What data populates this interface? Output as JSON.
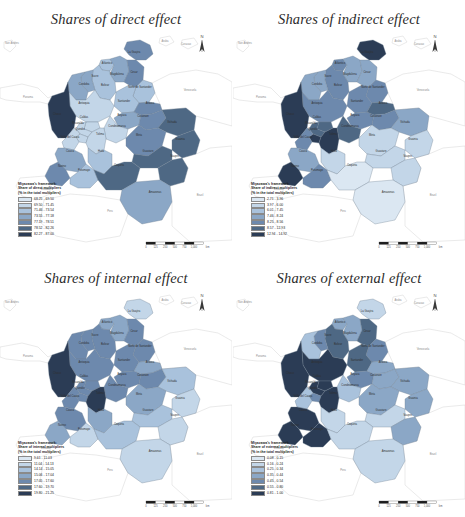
{
  "figure": {
    "kind": "choropleth-map-grid",
    "rows": 2,
    "columns": 2,
    "background": "#ffffff"
  },
  "palette": {
    "classes": [
      "#dbe7f2",
      "#c3d6e8",
      "#a9c2dc",
      "#8ba7c6",
      "#6d89ad",
      "#4e6884",
      "#2b3c55"
    ],
    "neighbor_fill": "#ffffff",
    "neighbor_stroke": "#c9c9c9",
    "boundary_stroke": "#6f7f90",
    "label_color": "#303030",
    "neighbor_label_color": "#8d8d8d",
    "title_color": "#2b2b2b"
  },
  "shared": {
    "north_arrow_label": "N",
    "scalebar": {
      "ticks": [
        "0",
        "125",
        "250",
        "500",
        "750",
        "1,000"
      ],
      "unit": "km",
      "segments": 6
    },
    "legend_line1": "Miyazawa's framework:",
    "legend_line3": "(% in the total multipliers)"
  },
  "panels": [
    {
      "id": "panel-1",
      "title": "Shares of direct effect",
      "legend": {
        "line1": "Miyazawa's framework:",
        "line2": "Share of direct multipliers",
        "line3": "(% in the total multipliers)",
        "classes": [
          {
            "label": "68.25 - 69.50",
            "color": "#dbe7f2"
          },
          {
            "label": "69.50 - 71.45",
            "color": "#c3d6e8"
          },
          {
            "label": "71.46 - 73.54",
            "color": "#a9c2dc"
          },
          {
            "label": "73.55 - 77.18",
            "color": "#8ba7c6"
          },
          {
            "label": "77.19 - 78.51",
            "color": "#6d89ad"
          },
          {
            "label": "78.52 - 82.26",
            "color": "#4e6884"
          },
          {
            "label": "82.27 - 87.00",
            "color": "#2b3c55"
          }
        ]
      },
      "region_classes": {
        "la-guajira": 4,
        "atlantico": 2,
        "magdalena": 3,
        "cesar": 4,
        "bolivar": 2,
        "sucre": 3,
        "cordoba": 3,
        "norte-santander": 2,
        "antioquia": 1,
        "santander": 2,
        "choco": 6,
        "caldas": 1,
        "risaralda": 1,
        "boyaca": 3,
        "arauca": 4,
        "quindio": 1,
        "cundinamarca": 1,
        "casanare": 4,
        "tolima": 1,
        "valle": 1,
        "vichada": 5,
        "huila": 2,
        "meta": 4,
        "cauca": 3,
        "guainia": 5,
        "narino": 4,
        "guaviare": 5,
        "caqueta": 5,
        "vaupes": 5,
        "putumayo": 2,
        "amazonas": 3
      }
    },
    {
      "id": "panel-2",
      "title": "Shares of indirect effect",
      "legend": {
        "line1": "Miyazawa's framework:",
        "line2": "Share of indirect multipliers",
        "line3": "(% in the total multipliers)",
        "classes": [
          {
            "label": "2.71 - 3.96",
            "color": "#dbe7f2"
          },
          {
            "label": "3.97 - 6.00",
            "color": "#c3d6e8"
          },
          {
            "label": "6.01 - 7.45",
            "color": "#a9c2dc"
          },
          {
            "label": "7.46 - 8.24",
            "color": "#8ba7c6"
          },
          {
            "label": "8.25 - 8.56",
            "color": "#6d89ad"
          },
          {
            "label": "8.57 - 12.93",
            "color": "#4e6884"
          },
          {
            "label": "12.94 - 14.92",
            "color": "#2b3c55"
          }
        ]
      },
      "region_classes": {
        "la-guajira": 6,
        "atlantico": 4,
        "magdalena": 3,
        "cesar": 3,
        "bolivar": 4,
        "sucre": 3,
        "cordoba": 3,
        "norte-santander": 4,
        "antioquia": 4,
        "santander": 4,
        "choco": 6,
        "caldas": 5,
        "risaralda": 5,
        "boyaca": 4,
        "arauca": 5,
        "quindio": 6,
        "cundinamarca": 5,
        "casanare": 4,
        "tolima": 6,
        "valle": 4,
        "vichada": 3,
        "huila": 1,
        "meta": 1,
        "cauca": 3,
        "guainia": 1,
        "narino": 6,
        "guaviare": 1,
        "caqueta": 0,
        "vaupes": 1,
        "putumayo": 4,
        "amazonas": 0
      }
    },
    {
      "id": "panel-3",
      "title": "Shares of internal effect",
      "legend": {
        "line1": "Miyazawa's framework:",
        "line2": "Share of internal multipliers",
        "line3": "(% in the total multipliers)",
        "classes": [
          {
            "label": "9.61 - 11.03",
            "color": "#dbe7f2"
          },
          {
            "label": "11.04 - 14.13",
            "color": "#c3d6e8"
          },
          {
            "label": "14.14 - 15.05",
            "color": "#a9c2dc"
          },
          {
            "label": "15.06 - 17.04",
            "color": "#8ba7c6"
          },
          {
            "label": "17.05 - 17.60",
            "color": "#6d89ad"
          },
          {
            "label": "17.60 - 19.70",
            "color": "#4e6884"
          },
          {
            "label": "19.80 - 21.25",
            "color": "#2b3c55"
          }
        ]
      },
      "region_classes": {
        "la-guajira": 1,
        "atlantico": 3,
        "magdalena": 3,
        "cesar": 4,
        "bolivar": 4,
        "sucre": 4,
        "cordoba": 4,
        "norte-santander": 4,
        "antioquia": 4,
        "santander": 4,
        "choco": 6,
        "caldas": 4,
        "risaralda": 4,
        "boyaca": 4,
        "arauca": 3,
        "quindio": 4,
        "cundinamarca": 4,
        "casanare": 4,
        "tolima": 6,
        "valle": 4,
        "vichada": 2,
        "huila": 3,
        "meta": 3,
        "cauca": 4,
        "guainia": 1,
        "narino": 3,
        "guaviare": 2,
        "caqueta": 2,
        "vaupes": 1,
        "putumayo": 1,
        "amazonas": 1
      }
    },
    {
      "id": "panel-4",
      "title": "Shares of external effect",
      "legend": {
        "line1": "Miyazawa's framework:",
        "line2": "Share of external multipliers",
        "line3": "(% in the total multipliers)",
        "classes": [
          {
            "label": "0.08 - 0.15",
            "color": "#dbe7f2"
          },
          {
            "label": "0.16 - 0.24",
            "color": "#c3d6e8"
          },
          {
            "label": "0.25 - 0.34",
            "color": "#a9c2dc"
          },
          {
            "label": "0.35 - 0.44",
            "color": "#8ba7c6"
          },
          {
            "label": "0.45 - 0.54",
            "color": "#6d89ad"
          },
          {
            "label": "0.55 - 0.80",
            "color": "#4e6884"
          },
          {
            "label": "0.81 - 1.00",
            "color": "#2b3c55"
          }
        ]
      },
      "region_classes": {
        "la-guajira": 1,
        "atlantico": 3,
        "magdalena": 3,
        "cesar": 5,
        "bolivar": 5,
        "sucre": 4,
        "cordoba": 2,
        "norte-santander": 4,
        "antioquia": 6,
        "santander": 5,
        "choco": 6,
        "caldas": 6,
        "risaralda": 6,
        "boyaca": 4,
        "arauca": 3,
        "quindio": 4,
        "cundinamarca": 2,
        "casanare": 3,
        "tolima": 6,
        "valle": 2,
        "vichada": 3,
        "huila": 1,
        "meta": 3,
        "cauca": 6,
        "guainia": 3,
        "narino": 6,
        "guaviare": 1,
        "caqueta": 1,
        "vaupes": 3,
        "putumayo": 6,
        "amazonas": 1
      }
    }
  ],
  "region_labels": [
    {
      "id": "la-guajira",
      "name": "La Guajira",
      "x": 134,
      "y": 23
    },
    {
      "id": "atlantico",
      "name": "Atlantico",
      "x": 107,
      "y": 34
    },
    {
      "id": "magdalena",
      "name": "Magdalena",
      "x": 117,
      "y": 45
    },
    {
      "id": "cesar",
      "name": "Cesar",
      "x": 134,
      "y": 43
    },
    {
      "id": "bolivar",
      "name": "Bolivar",
      "x": 105,
      "y": 56
    },
    {
      "id": "sucre",
      "name": "Sucre",
      "x": 95,
      "y": 47
    },
    {
      "id": "cordoba",
      "name": "Cordoba",
      "x": 84,
      "y": 55
    },
    {
      "id": "norte-santander",
      "name": "Norte de Santander",
      "x": 140,
      "y": 58
    },
    {
      "id": "santander",
      "name": "Santander",
      "x": 124,
      "y": 72
    },
    {
      "id": "antioquia",
      "name": "Antioquia",
      "x": 84,
      "y": 74
    },
    {
      "id": "choco",
      "name": "Choco",
      "x": 57,
      "y": 85
    },
    {
      "id": "boyaca",
      "name": "Boyaca",
      "x": 122,
      "y": 86
    },
    {
      "id": "arauca",
      "name": "Arauca",
      "x": 150,
      "y": 74
    },
    {
      "id": "caldas",
      "name": "Caldas",
      "x": 84,
      "y": 88
    },
    {
      "id": "risaralda",
      "name": "Risaralda",
      "x": 78,
      "y": 94
    },
    {
      "id": "casanare",
      "name": "Casanare",
      "x": 143,
      "y": 87
    },
    {
      "id": "quindio",
      "name": "Quindio",
      "x": 80,
      "y": 100
    },
    {
      "id": "cundinamarca",
      "name": "Cundinamarca",
      "x": 117,
      "y": 97
    },
    {
      "id": "vichada",
      "name": "Vichada",
      "x": 172,
      "y": 93
    },
    {
      "id": "valle",
      "name": "Valle del Cauca",
      "x": 70,
      "y": 108
    },
    {
      "id": "tolima",
      "name": "Tolima",
      "x": 100,
      "y": 105
    },
    {
      "id": "meta",
      "name": "Meta",
      "x": 139,
      "y": 106
    },
    {
      "id": "guainia",
      "name": "Guainia",
      "x": 180,
      "y": 110
    },
    {
      "id": "cauca",
      "name": "Cauca",
      "x": 70,
      "y": 122
    },
    {
      "id": "huila",
      "name": "Huila",
      "x": 101,
      "y": 122
    },
    {
      "id": "guaviare",
      "name": "Guaviare",
      "x": 148,
      "y": 122
    },
    {
      "id": "vaupes",
      "name": "Vaupes",
      "x": 175,
      "y": 127
    },
    {
      "id": "narino",
      "name": "Narino",
      "x": 62,
      "y": 137
    },
    {
      "id": "putumayo",
      "name": "Putumayo",
      "x": 84,
      "y": 141
    },
    {
      "id": "caqueta",
      "name": "Caqueta",
      "x": 119,
      "y": 136
    },
    {
      "id": "amazonas",
      "name": "Amazonas",
      "x": 155,
      "y": 163
    }
  ],
  "neighbor_labels": [
    {
      "id": "san-andres",
      "name": "San Andres",
      "x": 12,
      "y": 14
    },
    {
      "id": "aruba",
      "name": "Aruba",
      "x": 165,
      "y": 12
    },
    {
      "id": "curacao",
      "name": "Curacao",
      "x": 186,
      "y": 15
    },
    {
      "id": "panama",
      "name": "Panama",
      "x": 28,
      "y": 68
    },
    {
      "id": "venezuela",
      "name": "Venezuela",
      "x": 190,
      "y": 61
    },
    {
      "id": "brazil",
      "name": "Brazil",
      "x": 200,
      "y": 166
    },
    {
      "id": "peru",
      "name": "Peru",
      "x": 110,
      "y": 182
    },
    {
      "id": "ecuador",
      "name": "Ecuador",
      "x": 46,
      "y": 160
    }
  ]
}
